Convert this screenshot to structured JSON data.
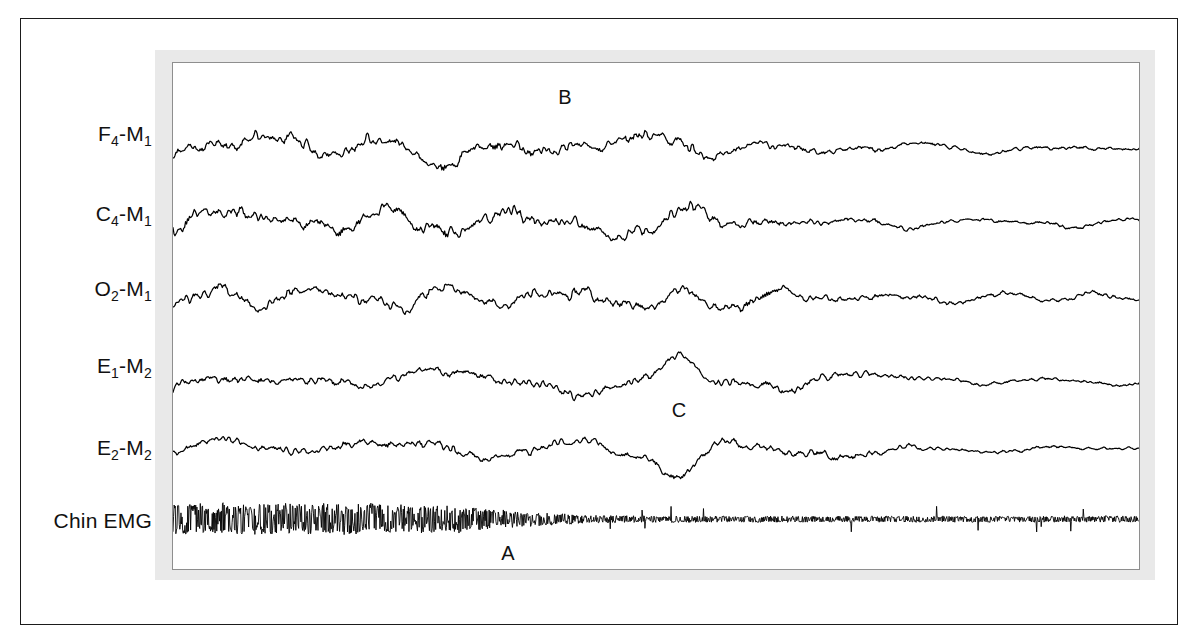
{
  "figure": {
    "frame_color": "#1b1b1b",
    "mat_color": "#e9e9e9",
    "panel_border_color": "#8e8e8e",
    "background": "#ffffff",
    "trace_color": "#000000"
  },
  "channels": [
    {
      "id": "f4m1",
      "label_main": "F",
      "label_sub": "4",
      "label_rest": "-M",
      "label_sub2": "1",
      "label_plain": "F4-M1",
      "label_y": 133
    },
    {
      "id": "c4m1",
      "label_main": "C",
      "label_sub": "4",
      "label_rest": "-M",
      "label_sub2": "1",
      "label_plain": "C4-M1",
      "label_y": 213
    },
    {
      "id": "o2m1",
      "label_main": "O",
      "label_sub": "2",
      "label_rest": "-M",
      "label_sub2": "1",
      "label_plain": "O2-M1",
      "label_y": 288
    },
    {
      "id": "e1m2",
      "label_main": "E",
      "label_sub": "1",
      "label_rest": "-M",
      "label_sub2": "2",
      "label_plain": "E1-M2",
      "label_y": 365
    },
    {
      "id": "e2m2",
      "label_main": "E",
      "label_sub": "2",
      "label_rest": "-M",
      "label_sub2": "2",
      "label_plain": "E2-M2",
      "label_y": 447
    },
    {
      "id": "chinemg",
      "label_main": "Chin EMG",
      "label_sub": "",
      "label_rest": "",
      "label_sub2": "",
      "label_plain": "Chin EMG",
      "label_y": 520
    }
  ],
  "annotations": [
    {
      "id": "b",
      "text": "B",
      "x": 565,
      "y": 97
    },
    {
      "id": "c",
      "text": "C",
      "x": 679,
      "y": 410
    },
    {
      "id": "a",
      "text": "A",
      "x": 508,
      "y": 553
    }
  ],
  "chart_data": {
    "type": "line",
    "title": "",
    "subtitle": "",
    "xlabel": "",
    "ylabel": "",
    "grid": false,
    "legend": "none",
    "x_range": [
      0,
      968
    ],
    "sampling_points": 1000,
    "event_markers": {
      "arousal_onset_x": 760,
      "eye_movement_x": 679
    },
    "series": [
      {
        "name": "F4-M1",
        "channel_id": "f4m1",
        "baseline_y": 85,
        "amplitude_left": 22,
        "amplitude_right": 8,
        "transition_x": 600,
        "transition_width": 200,
        "components": [
          {
            "freq": 7.5,
            "amp": 1.0,
            "phase": 0.0
          },
          {
            "freq": 11.0,
            "amp": 0.62,
            "phase": 1.3
          },
          {
            "freq": 3.2,
            "amp": 0.55,
            "phase": 2.4
          },
          {
            "freq": 18.0,
            "amp": 0.28,
            "phase": 0.7
          },
          {
            "freq": 27.0,
            "amp": 0.16,
            "phase": 3.1
          },
          {
            "freq": 1.6,
            "amp": 0.32,
            "phase": 5.0
          }
        ],
        "noise": 0.3,
        "seed": 1101
      },
      {
        "name": "C4-M1",
        "channel_id": "c4m1",
        "baseline_y": 160,
        "amplitude_left": 23,
        "amplitude_right": 8,
        "transition_x": 610,
        "transition_width": 190,
        "components": [
          {
            "freq": 6.8,
            "amp": 1.0,
            "phase": 0.9
          },
          {
            "freq": 10.5,
            "amp": 0.7,
            "phase": 2.2
          },
          {
            "freq": 3.6,
            "amp": 0.5,
            "phase": 4.0
          },
          {
            "freq": 16.0,
            "amp": 0.3,
            "phase": 1.8
          },
          {
            "freq": 24.0,
            "amp": 0.18,
            "phase": 0.4
          },
          {
            "freq": 1.9,
            "amp": 0.3,
            "phase": 3.7
          }
        ],
        "noise": 0.3,
        "seed": 2202
      },
      {
        "name": "O2-M1",
        "channel_id": "o2m1",
        "baseline_y": 236,
        "amplitude_left": 19,
        "amplitude_right": 9,
        "transition_x": 640,
        "transition_width": 200,
        "components": [
          {
            "freq": 8.5,
            "amp": 1.0,
            "phase": 2.7
          },
          {
            "freq": 12.5,
            "amp": 0.58,
            "phase": 0.3
          },
          {
            "freq": 4.0,
            "amp": 0.46,
            "phase": 1.1
          },
          {
            "freq": 19.0,
            "amp": 0.3,
            "phase": 4.4
          },
          {
            "freq": 29.0,
            "amp": 0.17,
            "phase": 2.0
          },
          {
            "freq": 2.1,
            "amp": 0.26,
            "phase": 0.8
          }
        ],
        "noise": 0.32,
        "seed": 3303
      },
      {
        "name": "E1-M2",
        "channel_id": "e1m2",
        "baseline_y": 320,
        "amplitude_left": 17,
        "amplitude_right": 7,
        "transition_x": 700,
        "transition_width": 150,
        "components": [
          {
            "freq": 5.0,
            "amp": 1.0,
            "phase": 1.5
          },
          {
            "freq": 9.0,
            "amp": 0.52,
            "phase": 3.3
          },
          {
            "freq": 2.4,
            "amp": 0.62,
            "phase": 0.2
          },
          {
            "freq": 14.0,
            "amp": 0.24,
            "phase": 2.8
          },
          {
            "freq": 22.0,
            "amp": 0.14,
            "phase": 5.5
          },
          {
            "freq": 1.2,
            "amp": 0.4,
            "phase": 4.1
          }
        ],
        "noise": 0.26,
        "seed": 4404,
        "deflection": {
          "x": 507,
          "width": 30,
          "height": -26
        }
      },
      {
        "name": "E2-M2",
        "channel_id": "e2m2",
        "baseline_y": 388,
        "amplitude_left": 17,
        "amplitude_right": 7,
        "transition_x": 700,
        "transition_width": 150,
        "components": [
          {
            "freq": 5.2,
            "amp": 1.0,
            "phase": 4.2
          },
          {
            "freq": 8.6,
            "amp": 0.54,
            "phase": 1.0
          },
          {
            "freq": 2.6,
            "amp": 0.6,
            "phase": 2.9
          },
          {
            "freq": 13.0,
            "amp": 0.25,
            "phase": 0.6
          },
          {
            "freq": 21.0,
            "amp": 0.15,
            "phase": 3.9
          },
          {
            "freq": 1.4,
            "amp": 0.38,
            "phase": 1.7
          }
        ],
        "noise": 0.26,
        "seed": 5505,
        "deflection": {
          "x": 507,
          "width": 30,
          "height": 34
        }
      },
      {
        "name": "Chin EMG",
        "channel_id": "chinemg",
        "baseline_y": 458,
        "amplitude_left": 15,
        "amplitude_right": 3,
        "transition_x": 330,
        "transition_width": 160,
        "emg": true,
        "noise": 1.0,
        "seed": 6606
      }
    ]
  }
}
